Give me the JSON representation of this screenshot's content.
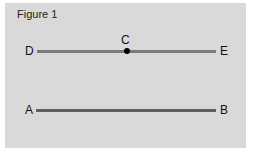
{
  "figure": {
    "title": "Figure 1",
    "points": {
      "A": "A",
      "B": "B",
      "C": "C",
      "D": "D",
      "E": "E"
    },
    "segments": [
      {
        "name": "DE",
        "from": "D",
        "to": "E",
        "midpoint_marked": "C"
      },
      {
        "name": "AB",
        "from": "A",
        "to": "B"
      }
    ],
    "colors": {
      "background": "#d9d9d9",
      "line_de": "#7a7a7a",
      "line_ab": "#5e5e5e",
      "point": "#000000"
    }
  }
}
